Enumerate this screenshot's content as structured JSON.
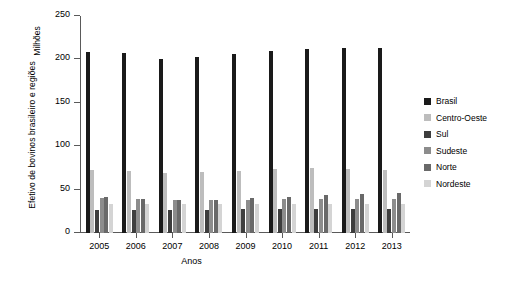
{
  "chart_data": {
    "type": "bar",
    "title": "",
    "xlabel": "Anos",
    "ylabel": "Efetivo de bovinos brasileiro e regiões",
    "yunit": "Milhões",
    "ylim": [
      0,
      250
    ],
    "yticks": [
      0,
      50,
      100,
      150,
      200,
      250
    ],
    "grid": false,
    "legend_position": "right",
    "categories": [
      "2005",
      "2006",
      "2007",
      "2008",
      "2009",
      "2010",
      "2011",
      "2012",
      "2013"
    ],
    "series": [
      {
        "name": "Brasil",
        "color": "#1a1a1a",
        "values": [
          209,
          207,
          201,
          203,
          206,
          210,
          212,
          213,
          213
        ]
      },
      {
        "name": "Centro-Oeste",
        "color": "#bdbdbd",
        "values": [
          73,
          71,
          69,
          70,
          72,
          74,
          75,
          74,
          73
        ]
      },
      {
        "name": "Sul",
        "color": "#3d3d3d",
        "values": [
          27,
          27,
          27,
          27,
          28,
          28,
          28,
          28,
          28
        ]
      },
      {
        "name": "Sudeste",
        "color": "#8c8c8c",
        "values": [
          40,
          39,
          38,
          38,
          38,
          39,
          39,
          39,
          39
        ]
      },
      {
        "name": "Norte",
        "color": "#696969",
        "values": [
          41,
          39,
          38,
          38,
          40,
          42,
          44,
          45,
          46
        ]
      },
      {
        "name": "Nordeste",
        "color": "#d4d4d4",
        "values": [
          33,
          33,
          33,
          33,
          33,
          33,
          33,
          33,
          33
        ]
      }
    ]
  },
  "legend": {
    "items": [
      {
        "label": "Brasil",
        "color": "#1a1a1a"
      },
      {
        "label": "Centro-Oeste",
        "color": "#bdbdbd"
      },
      {
        "label": "Sul",
        "color": "#3d3d3d"
      },
      {
        "label": "Sudeste",
        "color": "#8c8c8c"
      },
      {
        "label": "Norte",
        "color": "#696969"
      },
      {
        "label": "Nordeste",
        "color": "#d4d4d4"
      }
    ]
  }
}
